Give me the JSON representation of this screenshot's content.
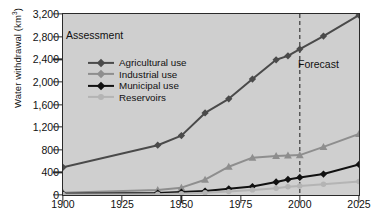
{
  "chart_data": {
    "type": "line",
    "title": "",
    "xlabel": "",
    "ylabel": "Water withdrawal (km3)",
    "ylabel_base": "Water withdrawal (km",
    "ylabel_sup": "3",
    "ylabel_close": ")",
    "xlim": [
      1900,
      2025
    ],
    "ylim": [
      0,
      3200
    ],
    "yticks": [
      0,
      400,
      800,
      1200,
      1600,
      2000,
      2400,
      2800,
      3200
    ],
    "ytick_labels": [
      "0",
      "400",
      "800",
      "1,200",
      "1,600",
      "2,000",
      "2,400",
      "2,800",
      "3,200"
    ],
    "xticks": [
      1900,
      1925,
      1950,
      1975,
      2000,
      2025
    ],
    "xtick_labels": [
      "1900",
      "1925",
      "1950",
      "1975",
      "2000",
      "2025"
    ],
    "grid": false,
    "legend_position": "upper-left-inside",
    "annotations": [
      {
        "text": "Assessment",
        "x": 1905,
        "y": 2800,
        "name": "assessment-annotation"
      },
      {
        "text": "Forecast",
        "x": 2003,
        "y": 2380,
        "name": "forecast-annotation"
      }
    ],
    "vertical_divider": {
      "x": 2000,
      "style": "dashed",
      "color": "#3a3a3a"
    },
    "x": [
      1900,
      1940,
      1950,
      1960,
      1970,
      1980,
      1990,
      1995,
      2000,
      2010,
      2025
    ],
    "series": [
      {
        "name": "Agricultural use",
        "color": "#4a4a4a",
        "marker": "diamond",
        "values": [
          490,
          880,
          1050,
          1450,
          1700,
          2050,
          2390,
          2460,
          2580,
          2810,
          3180
        ]
      },
      {
        "name": "Industrial use",
        "color": "#8e8e8e",
        "marker": "triangle",
        "values": [
          40,
          90,
          130,
          270,
          500,
          660,
          690,
          700,
          705,
          850,
          1080
        ]
      },
      {
        "name": "Municipal use",
        "color": "#111111",
        "marker": "diamond",
        "values": [
          20,
          35,
          50,
          70,
          110,
          150,
          230,
          275,
          310,
          370,
          540
        ]
      },
      {
        "name": "Reservoirs",
        "color": "#b4b4b4",
        "marker": "circle",
        "values": [
          10,
          15,
          25,
          40,
          60,
          90,
          120,
          145,
          160,
          190,
          240
        ]
      }
    ]
  },
  "legend": {
    "items": [
      {
        "label": "Agricultural use",
        "color": "#4a4a4a",
        "marker": "diamond"
      },
      {
        "label": "Industrial use",
        "color": "#8e8e8e",
        "marker": "triangle"
      },
      {
        "label": "Municipal use",
        "color": "#111111",
        "marker": "diamond"
      },
      {
        "label": "Reservoirs",
        "color": "#b4b4b4",
        "marker": "circle"
      }
    ]
  }
}
